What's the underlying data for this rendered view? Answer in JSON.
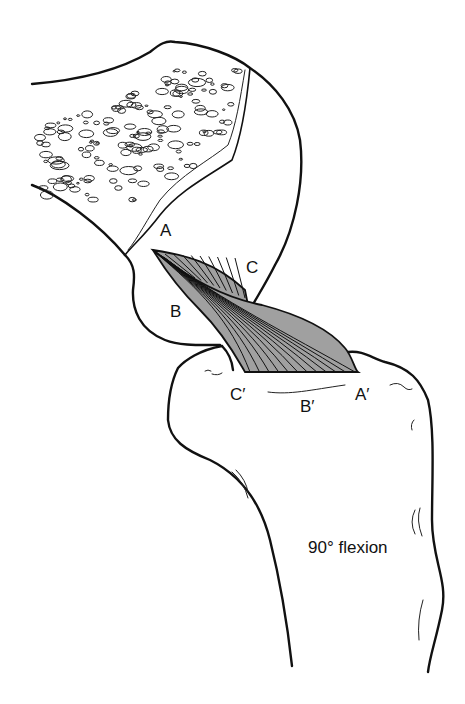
{
  "figure": {
    "caption": "90° flexion",
    "labels": {
      "femur_A": "A",
      "femur_B": "B",
      "femur_C": "C",
      "tibia_A": "A′",
      "tibia_B": "B′",
      "tibia_C": "C′"
    },
    "colors": {
      "ink": "#111111",
      "ligament_fill": "#a0a0a0",
      "background": "#ffffff"
    }
  }
}
